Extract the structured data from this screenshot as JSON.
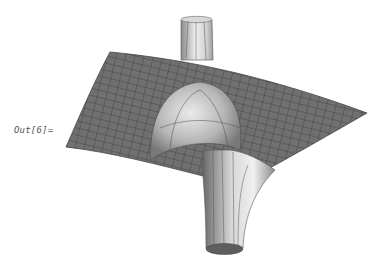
{
  "cell": {
    "output_label": "Out[6]="
  },
  "graphics": {
    "type": "3d-surface-plot",
    "description": "Surface with upward spike and downward funnel",
    "colors": {
      "mesh_fill": "#6f6f6f",
      "mesh_lines": "#3a3a3a",
      "tube_light": "#e6e6e6",
      "tube_dark": "#7a7a7a",
      "background": "#ffffff"
    }
  }
}
